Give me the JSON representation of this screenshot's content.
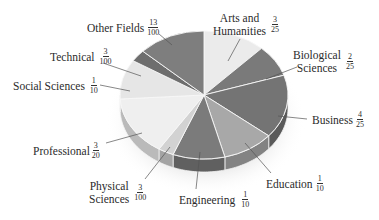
{
  "chart_data": {
    "type": "pie",
    "title": "",
    "style": "3d-grayscale",
    "start_angle_deg": 0,
    "direction": "clockwise",
    "slices": [
      {
        "label": "Arts and Humanities",
        "fraction": "3/25",
        "value": 0.12,
        "color": "#ebebeb"
      },
      {
        "label": "Biological Sciences",
        "fraction": "2/25",
        "value": 0.08,
        "color": "#7a7a7a"
      },
      {
        "label": "Business",
        "fraction": "4/25",
        "value": 0.16,
        "color": "#747474"
      },
      {
        "label": "Education",
        "fraction": "1/10",
        "value": 0.1,
        "color": "#a8a8a8"
      },
      {
        "label": "Engineering",
        "fraction": "1/10",
        "value": 0.1,
        "color": "#7b7b7b"
      },
      {
        "label": "Physical Sciences",
        "fraction": "3/100",
        "value": 0.03,
        "color": "#d2d2d2"
      },
      {
        "label": "Professional",
        "fraction": "3/20",
        "value": 0.15,
        "color": "#efefef"
      },
      {
        "label": "Social Sciences",
        "fraction": "1/10",
        "value": 0.1,
        "color": "#e6e6e6"
      },
      {
        "label": "Technical",
        "fraction": "3/100",
        "value": 0.03,
        "color": "#6e6e6e"
      },
      {
        "label": "Other Fields",
        "fraction": "13/100",
        "value": 0.13,
        "color": "#7e7e7e"
      }
    ],
    "legend": "none (leader-line labels)"
  },
  "labels": {
    "other": {
      "name": "Other Fields",
      "num": "13",
      "den": "100"
    },
    "technical": {
      "name": "Technical",
      "num": "3",
      "den": "100"
    },
    "social": {
      "name": "Social Sciences",
      "num": "1",
      "den": "10"
    },
    "professional": {
      "name": "Professional",
      "num": "3",
      "den": "20"
    },
    "physical": {
      "line1": "Physical",
      "line2": "Sciences",
      "num": "3",
      "den": "100"
    },
    "engineering": {
      "name": "Engineering",
      "num": "1",
      "den": "10"
    },
    "education": {
      "name": "Education",
      "num": "1",
      "den": "10"
    },
    "business": {
      "name": "Business",
      "num": "4",
      "den": "25"
    },
    "biological": {
      "line1": "Biological",
      "line2": "Sciences",
      "num": "2",
      "den": "25"
    },
    "arts": {
      "line1": "Arts and",
      "line2": "Humanities",
      "num": "3",
      "den": "25"
    }
  }
}
